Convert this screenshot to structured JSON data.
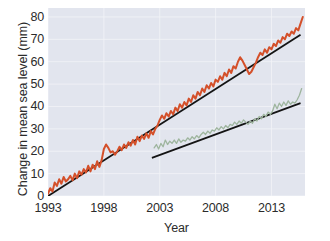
{
  "chart_data": {
    "type": "line",
    "title": "",
    "xlabel": "Year",
    "ylabel": "Change in mean sea level (mm)",
    "xlim": [
      1993,
      2016
    ],
    "ylim": [
      0,
      84
    ],
    "grid": true,
    "legend_position": "none",
    "xticks": [
      1993,
      1998,
      2003,
      2008,
      2013
    ],
    "xtick_labels": [
      "1993",
      "1998",
      "2003",
      "2008",
      "2013"
    ],
    "yticks": [
      0,
      10,
      20,
      30,
      40,
      50,
      60,
      70,
      80
    ],
    "ytick_labels": [
      "0",
      "10",
      "20",
      "30",
      "40",
      "50",
      "60",
      "70",
      "80"
    ],
    "colors": {
      "series_satellite_altimetry": "#d4502a",
      "series_tide_gauge": "#9eb59e",
      "trend_line": "#141414",
      "plot_background": "#e2e5ee",
      "grid_line": "#f2f4f8",
      "text": "#2b2b2b"
    },
    "series": [
      {
        "name": "Satellite altimetry sea level",
        "color": "#d4502a",
        "x": [
          1993.0,
          1993.2,
          1993.4,
          1993.6,
          1993.8,
          1994.0,
          1994.2,
          1994.4,
          1994.6,
          1994.8,
          1995.0,
          1995.2,
          1995.4,
          1995.6,
          1995.8,
          1996.0,
          1996.2,
          1996.4,
          1996.6,
          1996.8,
          1997.0,
          1997.2,
          1997.4,
          1997.6,
          1997.8,
          1998.0,
          1998.2,
          1998.4,
          1998.6,
          1998.8,
          1999.0,
          1999.2,
          1999.4,
          1999.6,
          1999.8,
          2000.0,
          2000.2,
          2000.4,
          2000.6,
          2000.8,
          2001.0,
          2001.2,
          2001.4,
          2001.6,
          2001.8,
          2002.0,
          2002.2,
          2002.4,
          2002.6,
          2002.8,
          2003.0,
          2003.2,
          2003.4,
          2003.6,
          2003.8,
          2004.0,
          2004.2,
          2004.4,
          2004.6,
          2004.8,
          2005.0,
          2005.2,
          2005.4,
          2005.6,
          2005.8,
          2006.0,
          2006.2,
          2006.4,
          2006.6,
          2006.8,
          2007.0,
          2007.2,
          2007.4,
          2007.6,
          2007.8,
          2008.0,
          2008.2,
          2008.4,
          2008.6,
          2008.8,
          2009.0,
          2009.2,
          2009.4,
          2009.6,
          2009.8,
          2010.0,
          2010.2,
          2010.4,
          2010.6,
          2010.8,
          2011.0,
          2011.2,
          2011.4,
          2011.6,
          2011.8,
          2012.0,
          2012.2,
          2012.4,
          2012.6,
          2012.8,
          2013.0,
          2013.2,
          2013.4,
          2013.6,
          2013.8,
          2014.0,
          2014.2,
          2014.4,
          2014.6,
          2014.8,
          2015.0,
          2015.2,
          2015.4,
          2015.6,
          2015.8
        ],
        "y": [
          1.0,
          3.5,
          2.0,
          6.0,
          4.5,
          7.5,
          5.5,
          8.5,
          6.5,
          7.5,
          9.0,
          7.0,
          10.0,
          8.0,
          11.0,
          9.5,
          12.0,
          10.5,
          13.5,
          11.0,
          14.0,
          12.0,
          15.5,
          13.0,
          16.0,
          21.0,
          23.0,
          21.5,
          19.5,
          20.0,
          18.5,
          20.0,
          22.0,
          20.5,
          23.0,
          21.5,
          24.0,
          22.5,
          25.0,
          23.0,
          26.5,
          24.5,
          27.0,
          25.5,
          28.0,
          26.0,
          29.0,
          27.5,
          30.0,
          31.5,
          34.0,
          36.0,
          34.5,
          37.0,
          35.5,
          38.0,
          36.5,
          39.5,
          38.0,
          41.0,
          39.5,
          42.0,
          40.5,
          43.5,
          42.0,
          45.0,
          43.5,
          46.5,
          45.0,
          48.0,
          46.5,
          49.5,
          48.0,
          50.5,
          49.0,
          52.0,
          51.0,
          53.5,
          52.0,
          55.0,
          53.5,
          56.5,
          55.0,
          58.0,
          57.0,
          60.0,
          62.0,
          60.5,
          58.5,
          56.5,
          54.5,
          55.5,
          57.5,
          59.5,
          62.0,
          64.0,
          63.0,
          65.5,
          64.0,
          66.5,
          65.5,
          68.0,
          67.0,
          69.5,
          68.5,
          71.0,
          70.0,
          72.5,
          71.5,
          73.5,
          72.5,
          75.0,
          74.0,
          77.0,
          80.0
        ]
      },
      {
        "name": "Tide gauge sea level",
        "color": "#9eb59e",
        "x": [
          2002.5,
          2002.7,
          2002.9,
          2003.1,
          2003.3,
          2003.5,
          2003.7,
          2003.9,
          2004.1,
          2004.3,
          2004.5,
          2004.7,
          2004.9,
          2005.1,
          2005.3,
          2005.5,
          2005.7,
          2005.9,
          2006.1,
          2006.3,
          2006.5,
          2006.7,
          2006.9,
          2007.1,
          2007.3,
          2007.5,
          2007.7,
          2007.9,
          2008.1,
          2008.3,
          2008.5,
          2008.7,
          2008.9,
          2009.1,
          2009.3,
          2009.5,
          2009.7,
          2009.9,
          2010.1,
          2010.3,
          2010.5,
          2010.7,
          2010.9,
          2011.1,
          2011.3,
          2011.5,
          2011.7,
          2011.9,
          2012.1,
          2012.3,
          2012.5,
          2012.7,
          2012.9,
          2013.1,
          2013.3,
          2013.5,
          2013.7,
          2013.9,
          2014.1,
          2014.3,
          2014.5,
          2014.7,
          2014.9,
          2015.1,
          2015.3,
          2015.5,
          2015.7
        ],
        "y": [
          21.5,
          23.0,
          21.0,
          23.5,
          22.0,
          25.0,
          23.0,
          24.5,
          23.5,
          25.0,
          23.5,
          25.5,
          24.0,
          25.0,
          24.5,
          26.0,
          25.0,
          26.5,
          25.5,
          27.0,
          26.0,
          27.5,
          28.5,
          27.5,
          29.0,
          28.0,
          29.5,
          29.0,
          30.5,
          29.5,
          31.0,
          30.0,
          31.5,
          30.5,
          32.0,
          31.5,
          33.0,
          32.0,
          33.5,
          32.5,
          34.0,
          33.0,
          32.0,
          33.5,
          32.5,
          34.5,
          33.5,
          35.5,
          34.5,
          36.5,
          35.5,
          37.5,
          36.5,
          38.0,
          41.0,
          39.0,
          41.5,
          40.0,
          42.0,
          40.5,
          42.5,
          41.0,
          42.0,
          41.5,
          43.0,
          45.0,
          48.0
        ]
      }
    ],
    "trend_lines": [
      {
        "name": "Satellite altimetry trend",
        "color": "#141414",
        "x": [
          1993.0,
          2015.6
        ],
        "y": [
          0.0,
          72.0
        ]
      },
      {
        "name": "Tide gauge trend",
        "color": "#141414",
        "x": [
          2002.3,
          2015.6
        ],
        "y": [
          17.0,
          41.5
        ]
      }
    ]
  }
}
